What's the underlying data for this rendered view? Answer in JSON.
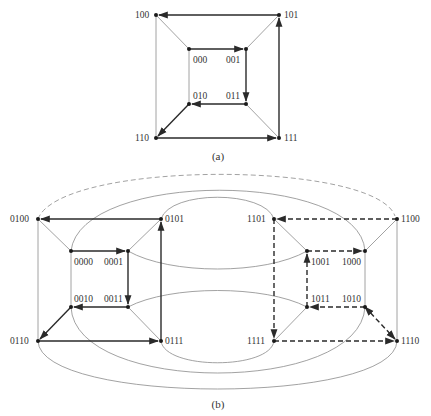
{
  "figure_a": {
    "caption": "(a)",
    "nodes": [
      {
        "id": "100",
        "x": 156,
        "y": 15,
        "lx": 137,
        "ly": 18
      },
      {
        "id": "101",
        "x": 279,
        "y": 15,
        "lx": 284,
        "ly": 18
      },
      {
        "id": "000",
        "x": 189,
        "y": 49,
        "lx": 192,
        "ly": 62
      },
      {
        "id": "001",
        "x": 246,
        "y": 49,
        "lx": 228,
        "ly": 62
      },
      {
        "id": "010",
        "x": 189,
        "y": 104,
        "lx": 192,
        "ly": 99
      },
      {
        "id": "011",
        "x": 246,
        "y": 104,
        "lx": 228,
        "ly": 99
      },
      {
        "id": "110",
        "x": 156,
        "y": 138,
        "lx": 137,
        "ly": 141
      },
      {
        "id": "111",
        "x": 279,
        "y": 138,
        "lx": 284,
        "ly": 141
      }
    ],
    "thin_edges": [
      [
        "100",
        "000"
      ],
      [
        "101",
        "001"
      ],
      [
        "010",
        "110"
      ],
      [
        "011",
        "111"
      ],
      [
        "100",
        "110"
      ],
      [
        "000",
        "010"
      ]
    ],
    "path_edges": [
      [
        "101",
        "100"
      ],
      [
        "000",
        "001"
      ],
      [
        "001",
        "011"
      ],
      [
        "011",
        "010"
      ],
      [
        "010",
        "110"
      ],
      [
        "110",
        "111"
      ],
      [
        "111",
        "101"
      ]
    ]
  },
  "figure_b": {
    "caption": "(b)",
    "nodes": [
      {
        "id": "0100",
        "x": 38,
        "y": 219
      },
      {
        "id": "0101",
        "x": 161,
        "y": 219
      },
      {
        "id": "0000",
        "x": 71,
        "y": 251
      },
      {
        "id": "0001",
        "x": 128,
        "y": 251
      },
      {
        "id": "0010",
        "x": 71,
        "y": 307
      },
      {
        "id": "0011",
        "x": 128,
        "y": 307
      },
      {
        "id": "0110",
        "x": 38,
        "y": 341
      },
      {
        "id": "0111",
        "x": 161,
        "y": 341
      },
      {
        "id": "1101",
        "x": 274,
        "y": 219
      },
      {
        "id": "1100",
        "x": 397,
        "y": 219
      },
      {
        "id": "1001",
        "x": 307,
        "y": 251
      },
      {
        "id": "1000",
        "x": 365,
        "y": 251
      },
      {
        "id": "1011",
        "x": 307,
        "y": 307
      },
      {
        "id": "1010",
        "x": 365,
        "y": 307
      },
      {
        "id": "1111",
        "x": 274,
        "y": 341
      },
      {
        "id": "1110",
        "x": 397,
        "y": 341
      }
    ],
    "solid_path_edges": [
      [
        "0101",
        "0100"
      ],
      [
        "0000",
        "0001"
      ],
      [
        "0001",
        "0011"
      ],
      [
        "0011",
        "0010"
      ],
      [
        "0010",
        "0110"
      ],
      [
        "0110",
        "0111"
      ],
      [
        "0111",
        "0101"
      ]
    ],
    "dashed_path_edges": [
      [
        "1100",
        "1101"
      ],
      [
        "1101",
        "1111"
      ],
      [
        "1111",
        "1110"
      ],
      [
        "1010",
        "1110"
      ],
      [
        "1010",
        "1011"
      ],
      [
        "1011",
        "1001"
      ],
      [
        "1001",
        "1000"
      ]
    ],
    "dashed_arc": [
      "0100",
      "1100"
    ],
    "arcs": [
      [
        "0000",
        "1000"
      ],
      [
        "0101",
        "1101"
      ],
      [
        "0001",
        "1001"
      ],
      [
        "0011",
        "1011"
      ],
      [
        "0111",
        "1111"
      ],
      [
        "0010",
        "1010"
      ],
      [
        "0110",
        "1110"
      ]
    ]
  }
}
